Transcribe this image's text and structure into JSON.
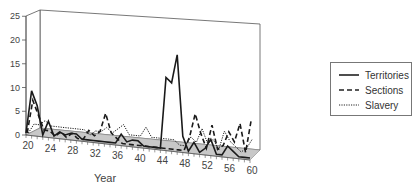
{
  "chart_data": {
    "type": "line",
    "title": "",
    "xlabel": "Year",
    "ylabel": "",
    "ylim": [
      0,
      25
    ],
    "yticks": [
      0,
      5,
      10,
      15,
      20,
      25
    ],
    "xticks": [
      20,
      24,
      28,
      32,
      36,
      40,
      44,
      48,
      52,
      56,
      60
    ],
    "grid": false,
    "legend_position": "right",
    "style": "3d-perspective floor with gray shaded base",
    "x": [
      20,
      21,
      22,
      23,
      24,
      25,
      26,
      27,
      28,
      29,
      30,
      31,
      32,
      33,
      34,
      35,
      36,
      37,
      38,
      39,
      40,
      41,
      42,
      43,
      44,
      45,
      46,
      47,
      48,
      49,
      50,
      51,
      52,
      53,
      54,
      55,
      56,
      57,
      58,
      59,
      60
    ],
    "series": [
      {
        "name": "Territories",
        "line": "solid",
        "values": [
          0,
          9,
          6,
          0,
          3,
          0,
          1,
          0.5,
          1,
          1,
          0,
          0,
          0,
          0,
          0,
          0,
          0,
          2,
          0.5,
          1,
          1,
          0,
          0,
          0,
          0,
          15,
          14,
          20,
          3,
          0,
          2,
          0,
          1,
          3,
          0,
          0,
          2,
          1,
          0,
          0,
          0
        ]
      },
      {
        "name": "Sections",
        "line": "dashed",
        "values": [
          0,
          7,
          4,
          1,
          1,
          0,
          1,
          0,
          1,
          0,
          0,
          2,
          1,
          2,
          6,
          2,
          1,
          0,
          0,
          0,
          0,
          0,
          0,
          0,
          0,
          0,
          0,
          0,
          0,
          3,
          8,
          4,
          1,
          6,
          1,
          2,
          5,
          3,
          7,
          1,
          8
        ]
      },
      {
        "name": "Slavery",
        "line": "dotted",
        "values": [
          0,
          2,
          2,
          3,
          2,
          2,
          2,
          2,
          2,
          2,
          2,
          1,
          2,
          2,
          3,
          2,
          3,
          4,
          2,
          2,
          2,
          4,
          2,
          2,
          2,
          2,
          2,
          1,
          1,
          3,
          2,
          5,
          2,
          3,
          1,
          5,
          3,
          2,
          1,
          2,
          4
        ]
      }
    ]
  },
  "legend": {
    "items": [
      {
        "label": "Territories"
      },
      {
        "label": "Sections"
      },
      {
        "label": "Slavery"
      }
    ]
  },
  "axes": {
    "xlabel": "Year",
    "ytick_labels": [
      "0",
      "5",
      "10",
      "15",
      "20",
      "25"
    ],
    "xtick_labels": [
      "20",
      "24",
      "28",
      "32",
      "36",
      "40",
      "44",
      "48",
      "52",
      "56",
      "60"
    ]
  }
}
